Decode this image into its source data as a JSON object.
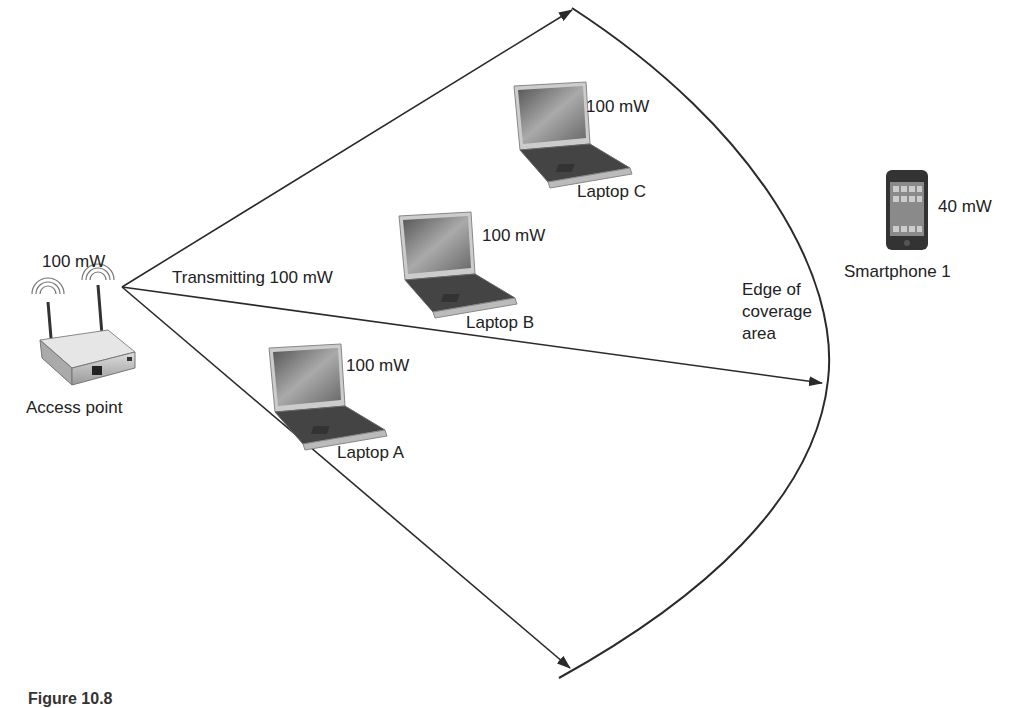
{
  "diagram": {
    "access_point": {
      "label": "Access point",
      "power": "100 mW",
      "transmit_label": "Transmitting 100 mW"
    },
    "laptops": [
      {
        "label": "Laptop A",
        "power": "100 mW"
      },
      {
        "label": "Laptop B",
        "power": "100 mW"
      },
      {
        "label": "Laptop C",
        "power": "100 mW"
      }
    ],
    "smartphone": {
      "label": "Smartphone 1",
      "power": "40 mW"
    },
    "coverage_edge": {
      "label_line1": "Edge of",
      "label_line2": "coverage",
      "label_line3": "area"
    },
    "caption": "Figure 10.8"
  },
  "colors": {
    "line": "#2a2a2a",
    "text": "#222222",
    "background": "#ffffff"
  }
}
